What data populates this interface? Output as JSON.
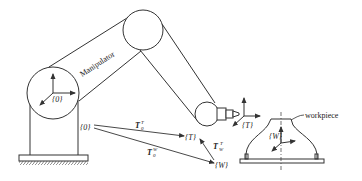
{
  "diagram": {
    "type": "robot-kinematics-schematic",
    "labels": {
      "manipulator": "Manipulator",
      "workpiece": "workpiece",
      "base_frame_in_joint": "{0}",
      "base_frame": "{0}",
      "tool_frame": "{T}",
      "tool_frame_target": "{T}",
      "workpiece_frame": "{W}",
      "workpiece_frame_target": "{W}"
    },
    "transforms": [
      {
        "id": "T0T",
        "base": "T",
        "sub": "0",
        "sup": "T",
        "from": "{0}",
        "to": "{T}"
      },
      {
        "id": "T0W",
        "base": "T",
        "sub": "0",
        "sup": "W",
        "from": "{0}",
        "to": "{W}"
      },
      {
        "id": "TWT",
        "base": "T",
        "sub": "W",
        "sup": "T",
        "from": "{W}",
        "to": "{T}"
      }
    ],
    "colors": {
      "stroke": "#333333",
      "background": "#ffffff"
    }
  }
}
